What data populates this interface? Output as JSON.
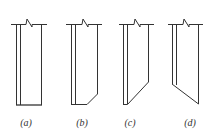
{
  "diagram": {
    "type": "wall-edge details",
    "colors": {
      "line": "#333333",
      "background": "#ffffff"
    },
    "figures": [
      {
        "id": "a",
        "label": "(a)",
        "description": "straight wall edge, square bottom"
      },
      {
        "id": "b",
        "label": "(b)",
        "description": "wall edge with small chamfer at bottom right"
      },
      {
        "id": "c",
        "label": "(c)",
        "description": "wall edge with long diagonal cut toward bottom left"
      },
      {
        "id": "d",
        "label": "(d)",
        "description": "wall edge with diagonal cut toward bottom right"
      }
    ]
  }
}
